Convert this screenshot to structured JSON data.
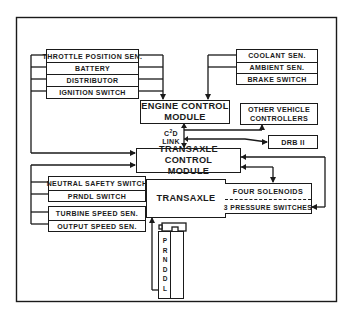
{
  "diagram": {
    "engine_inputs": [
      "THROTTLE POSITION SEN.",
      "BATTERY",
      "DISTRIBUTOR",
      "IGNITION SWITCH"
    ],
    "engine_inputs_right": [
      "COOLANT SEN.",
      "AMBIENT SEN.",
      "BRAKE SWITCH"
    ],
    "engine_control_module": [
      "ENGINE CONTROL",
      "MODULE"
    ],
    "other_vehicle_controllers": [
      "OTHER VEHICLE",
      "CONTROLLERS"
    ],
    "c2d_link": {
      "line1_base": "C",
      "line1_sup": "2",
      "line1_tail": "D",
      "line2": "LINK"
    },
    "drb": "DRB II",
    "transaxle_control_module": [
      "TRANSAXLE CONTROL",
      "MODULE"
    ],
    "transaxle_inputs_group1": [
      "NEUTRAL SAFETY SWITCH",
      "PRNDL SWITCH"
    ],
    "transaxle_inputs_group2": [
      "TURBINE SPEED SEN.",
      "OUTPUT SPEED SEN."
    ],
    "transaxle": "TRANSAXLE",
    "solenoids": "FOUR SOLENOIDS",
    "pressure_switches": "3 PRESSURE SWITCHES",
    "gear_selector_positions": [
      "P",
      "R",
      "N",
      "D",
      "D",
      "L"
    ]
  }
}
